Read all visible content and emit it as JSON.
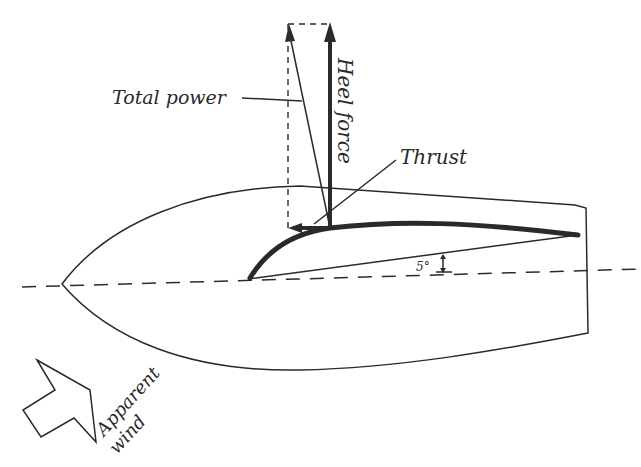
{
  "diagram": {
    "type": "sail force diagram",
    "labels": {
      "total_power": "Total power",
      "heel_force": "Heel force",
      "thrust": "Thrust",
      "angle": "5°",
      "apparent": "Apparent",
      "wind": "wind"
    },
    "colors": {
      "ink": "#2a2a2a",
      "background": "#ffffff"
    }
  }
}
